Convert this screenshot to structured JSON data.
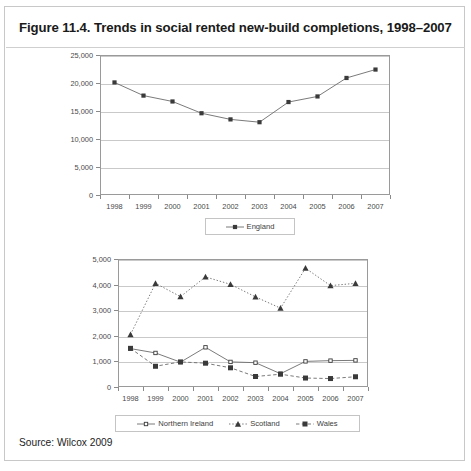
{
  "figure": {
    "title": "Figure 11.4. Trends in social rented new-build completions, 1998–2007",
    "source": "Source: Wilcox 2009",
    "body_text_fragment": "The ... text ... continues below the figure"
  },
  "colors": {
    "border": "#c8c8c8",
    "axis": "#9a9a9a",
    "grid": "#c9c9c9",
    "series_line": "#6b6b6b",
    "marker": "#3a3a3a",
    "text": "#4a4a4a"
  },
  "chart_data": [
    {
      "type": "line",
      "id": "england-chart",
      "title": "",
      "xlabel": "",
      "ylabel": "",
      "categories": [
        "1998",
        "1999",
        "2000",
        "2001",
        "2002",
        "2003",
        "2004",
        "2005",
        "2006",
        "2007"
      ],
      "ylim": [
        0,
        25000
      ],
      "yticks": [
        0,
        5000,
        10000,
        15000,
        20000,
        25000
      ],
      "ytick_labels": [
        "0",
        "5,000",
        "10,000",
        "15,000",
        "20,000",
        "25,000"
      ],
      "grid": true,
      "legend_position": "bottom",
      "series": [
        {
          "name": "England",
          "marker": "square",
          "linestyle": "solid",
          "values": [
            20100,
            17750,
            16700,
            14600,
            13500,
            13000,
            16600,
            17600,
            20900,
            22400
          ]
        }
      ]
    },
    {
      "type": "line",
      "id": "nations-chart",
      "title": "",
      "xlabel": "",
      "ylabel": "",
      "categories": [
        "1998",
        "1999",
        "2000",
        "2001",
        "2002",
        "2003",
        "2004",
        "2005",
        "2006",
        "2007"
      ],
      "ylim": [
        0,
        5000
      ],
      "yticks": [
        0,
        1000,
        2000,
        3000,
        4000,
        5000
      ],
      "ytick_labels": [
        "0",
        "1,000",
        "2,000",
        "3,000",
        "4,000",
        "5,000"
      ],
      "grid": true,
      "legend_position": "bottom",
      "series": [
        {
          "name": "Northern Ireland",
          "marker": "square-small",
          "linestyle": "solid",
          "values": [
            1500,
            1330,
            970,
            1550,
            980,
            950,
            520,
            1000,
            1030,
            1040
          ]
        },
        {
          "name": "Scotland",
          "marker": "triangle",
          "linestyle": "dotted",
          "values": [
            2050,
            4050,
            3530,
            4300,
            4010,
            3520,
            3080,
            4640,
            3960,
            4050
          ]
        },
        {
          "name": "Wales",
          "marker": "square-filled",
          "linestyle": "dashed",
          "values": [
            1510,
            810,
            980,
            930,
            750,
            410,
            500,
            350,
            330,
            400
          ]
        }
      ]
    }
  ]
}
